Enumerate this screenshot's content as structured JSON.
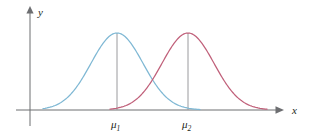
{
  "figure": {
    "title": "",
    "background_color": "#ffffff"
  },
  "axes": {
    "x_axis": {
      "label": "x",
      "icon": "arrow-right-icon",
      "color": "#6d6e71",
      "baseline_y": 110,
      "start_x": 16,
      "end_x": 283
    },
    "y_axis": {
      "label": "y",
      "icon": "arrow-up-icon",
      "color": "#6d6e71",
      "axis_x": 30,
      "top_y": 8,
      "bottom_y": 126
    }
  },
  "tick_labels": [
    {
      "name": "mu-1",
      "base": "μ",
      "subscript": "1",
      "x": 117
    },
    {
      "name": "mu-2",
      "base": "μ",
      "subscript": "2",
      "x": 188
    }
  ],
  "drop_lines": [
    {
      "name": "drop-line-mu-1",
      "x": 117,
      "top_y": 33,
      "bottom_y": 110,
      "color": "#9a9a9d"
    },
    {
      "name": "drop-line-mu-2",
      "x": 188,
      "top_y": 33,
      "bottom_y": 110,
      "color": "#9a9a9d"
    }
  ],
  "chart_data": {
    "type": "line",
    "title": "",
    "xlabel": "x",
    "ylabel": "y",
    "grid": false,
    "legend": "none",
    "annotations": [
      "μ₁",
      "μ₂"
    ],
    "xlim": [
      30,
      283
    ],
    "ylim": [
      0,
      1
    ],
    "series": [
      {
        "name": "curve-1",
        "color": "#7fb8d4",
        "distribution": "normal",
        "mean": 117,
        "sigma": 26,
        "peak_x": 117,
        "peak_y": 33,
        "baseline_y": 110,
        "x_start": 43,
        "x_end": 200,
        "x": [
          43,
          52,
          61,
          70,
          78,
          87,
          96,
          104,
          113,
          117,
          122,
          130,
          139,
          148,
          157,
          165,
          174,
          183,
          191,
          200
        ],
        "y": [
          108,
          106,
          103,
          97,
          89,
          78,
          63,
          49,
          37,
          33,
          35,
          45,
          60,
          74,
          87,
          96,
          102,
          106,
          108,
          109
        ]
      },
      {
        "name": "curve-2",
        "color": "#c0607a",
        "distribution": "normal",
        "mean": 188,
        "sigma": 26,
        "peak_x": 188,
        "peak_y": 33,
        "baseline_y": 110,
        "x_start": 110,
        "x_end": 267,
        "x": [
          110,
          119,
          128,
          137,
          145,
          154,
          163,
          171,
          180,
          188,
          193,
          201,
          210,
          219,
          228,
          236,
          245,
          254,
          262,
          267
        ],
        "y": [
          109,
          107,
          104,
          98,
          90,
          79,
          64,
          50,
          37,
          33,
          35,
          45,
          61,
          75,
          88,
          97,
          103,
          106,
          108,
          109
        ]
      }
    ],
    "intersection": {
      "x": 153,
      "y": 75
    }
  }
}
